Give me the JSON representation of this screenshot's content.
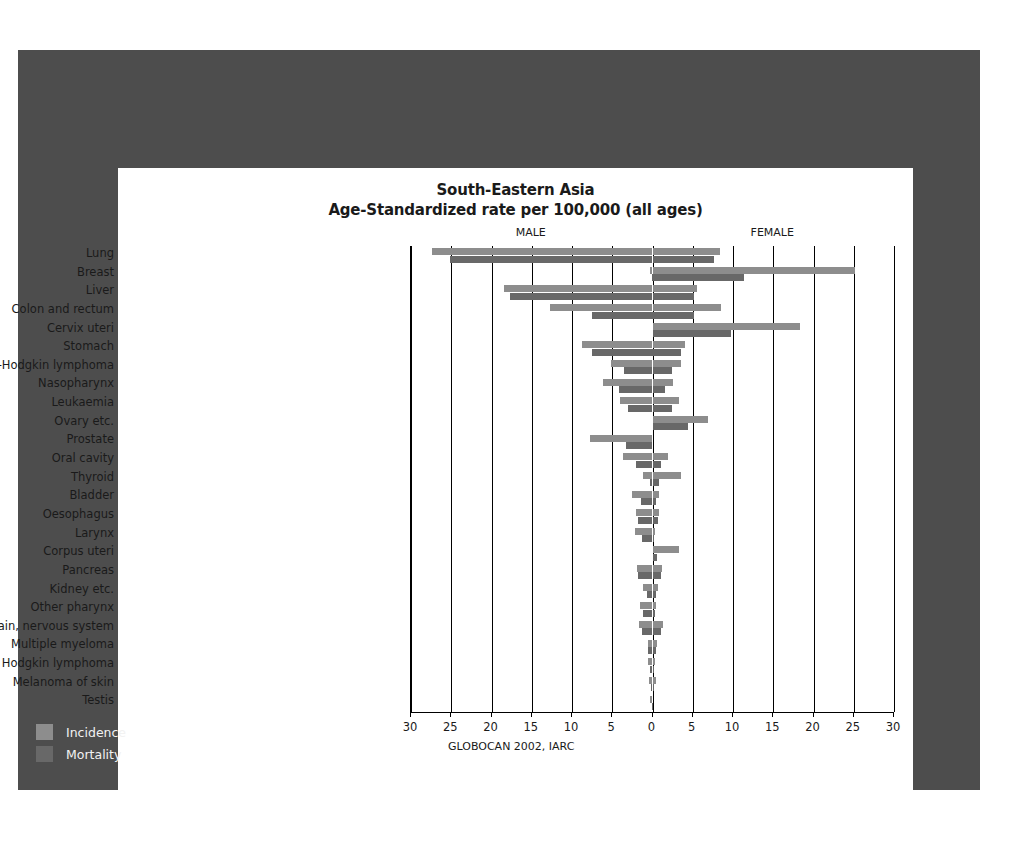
{
  "chart_data": {
    "type": "bar",
    "orientation": "horizontal",
    "layout": "diverging-population-pyramid",
    "title": "South-Eastern Asia",
    "subtitle": "Age-Standardized rate per 100,000 (all ages)",
    "source": "GLOBOCAN 2002, IARC",
    "xlabel": "",
    "ylabel": "",
    "left_panel_label": "MALE",
    "right_panel_label": "FEMALE",
    "xlim": [
      -30,
      30
    ],
    "xticks": [
      30,
      25,
      20,
      15,
      10,
      5,
      0,
      5,
      10,
      15,
      20,
      25,
      30
    ],
    "grid": true,
    "legend_position": "bottom-left",
    "legend": [
      {
        "name": "Incidence",
        "color": "#8d8d8d"
      },
      {
        "name": "Mortality",
        "color": "#686868"
      }
    ],
    "categories": [
      "Lung",
      "Breast",
      "Liver",
      "Colon and rectum",
      "Cervix uteri",
      "Stomach",
      "Non-Hodgkin lymphoma",
      "Nasopharynx",
      "Leukaemia",
      "Ovary etc.",
      "Prostate",
      "Oral cavity",
      "Thyroid",
      "Bladder",
      "Oesophagus",
      "Larynx",
      "Corpus uteri",
      "Pancreas",
      "Kidney etc.",
      "Other pharynx",
      "Brain, nervous system",
      "Multiple myeloma",
      "Hodgkin lymphoma",
      "Melanoma of skin",
      "Testis"
    ],
    "series": [
      {
        "name": "Male incidence",
        "sex": "male",
        "metric": "incidence",
        "color": "#8d8d8d",
        "values": [
          27.4,
          0.3,
          18.4,
          12.7,
          0.0,
          8.7,
          5.1,
          6.1,
          4.0,
          0.0,
          7.8,
          3.7,
          1.2,
          2.6,
          2.1,
          2.2,
          0.0,
          1.9,
          1.2,
          1.6,
          1.7,
          0.6,
          0.5,
          0.4,
          0.3
        ]
      },
      {
        "name": "Male mortality",
        "sex": "male",
        "metric": "mortality",
        "color": "#686868",
        "values": [
          25.1,
          0.1,
          17.7,
          7.5,
          0.0,
          7.5,
          3.5,
          4.2,
          3.0,
          0.0,
          3.3,
          2.1,
          0.3,
          1.4,
          1.8,
          1.3,
          0.0,
          1.8,
          0.7,
          1.2,
          1.3,
          0.5,
          0.3,
          0.2,
          0.1
        ]
      },
      {
        "name": "Female incidence",
        "sex": "female",
        "metric": "incidence",
        "color": "#8d8d8d",
        "values": [
          8.4,
          25.1,
          5.5,
          8.5,
          18.3,
          4.0,
          3.6,
          2.5,
          3.3,
          6.9,
          0.0,
          1.9,
          3.6,
          0.8,
          0.8,
          0.3,
          3.3,
          1.2,
          0.7,
          0.4,
          1.3,
          0.5,
          0.3,
          0.4,
          0.0
        ]
      },
      {
        "name": "Female mortality",
        "sex": "female",
        "metric": "mortality",
        "color": "#686868",
        "values": [
          7.6,
          11.4,
          5.2,
          5.1,
          9.8,
          3.5,
          2.4,
          1.6,
          2.4,
          4.4,
          0.0,
          1.1,
          0.8,
          0.4,
          0.7,
          0.2,
          0.6,
          1.1,
          0.4,
          0.3,
          1.0,
          0.4,
          0.2,
          0.2,
          0.0
        ]
      }
    ]
  }
}
